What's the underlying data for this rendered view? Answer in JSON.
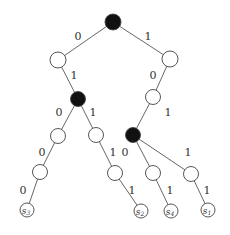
{
  "diagram": {
    "type": "binary-tree",
    "colors": {
      "filled": "#111111",
      "empty": "#ffffff",
      "edge": "#555555"
    },
    "nodes": [
      {
        "id": "root",
        "x": 113,
        "y": 22,
        "r": 8,
        "filled": true
      },
      {
        "id": "L1",
        "x": 58,
        "y": 60,
        "r": 8,
        "filled": false
      },
      {
        "id": "R1",
        "x": 170,
        "y": 59,
        "r": 8,
        "filled": false
      },
      {
        "id": "L2",
        "x": 78,
        "y": 99,
        "r": 7.5,
        "filled": true
      },
      {
        "id": "R2",
        "x": 153,
        "y": 97,
        "r": 7.5,
        "filled": false
      },
      {
        "id": "L3a",
        "x": 58,
        "y": 136,
        "r": 7.5,
        "filled": false
      },
      {
        "id": "L3b",
        "x": 96,
        "y": 135,
        "r": 7.5,
        "filled": false
      },
      {
        "id": "R3",
        "x": 133,
        "y": 135,
        "r": 7.5,
        "filled": true
      },
      {
        "id": "L4a",
        "x": 40,
        "y": 172,
        "r": 7.5,
        "filled": false
      },
      {
        "id": "L4b",
        "x": 115,
        "y": 173,
        "r": 7.5,
        "filled": false
      },
      {
        "id": "R4a",
        "x": 153,
        "y": 173,
        "r": 7.5,
        "filled": false
      },
      {
        "id": "R4b",
        "x": 191,
        "y": 174,
        "r": 7.5,
        "filled": false
      },
      {
        "id": "s3",
        "x": 27,
        "y": 210,
        "r": 7,
        "filled": false,
        "label": "s",
        "sub": "3"
      },
      {
        "id": "s2",
        "x": 141,
        "y": 211,
        "r": 7,
        "filled": false,
        "label": "s",
        "sub": "2"
      },
      {
        "id": "s4",
        "x": 171,
        "y": 211,
        "r": 7,
        "filled": false,
        "label": "s",
        "sub": "4"
      },
      {
        "id": "s1",
        "x": 208,
        "y": 210,
        "r": 7,
        "filled": false,
        "label": "s",
        "sub": "1"
      }
    ],
    "edges": [
      {
        "from": "root",
        "to": "L1",
        "label": "0",
        "lx": 78,
        "ly": 37
      },
      {
        "from": "root",
        "to": "R1",
        "label": "1",
        "lx": 148,
        "ly": 37
      },
      {
        "from": "L1",
        "to": "L2",
        "label": "1",
        "lx": 74,
        "ly": 76
      },
      {
        "from": "R1",
        "to": "R2",
        "label": "0",
        "lx": 153,
        "ly": 76
      },
      {
        "from": "L2",
        "to": "L3a",
        "label": "0",
        "lx": 59,
        "ly": 113
      },
      {
        "from": "L2",
        "to": "L3b",
        "label": "1",
        "lx": 93,
        "ly": 113
      },
      {
        "from": "R2",
        "to": "R3",
        "label": "1",
        "lx": 168,
        "ly": 113
      },
      {
        "from": "L3a",
        "to": "L4a",
        "label": "0",
        "lx": 42,
        "ly": 153
      },
      {
        "from": "L3b",
        "to": "L4b",
        "label": "1",
        "lx": 113,
        "ly": 153
      },
      {
        "from": "R3",
        "to": "R4a",
        "label": "0",
        "lx": 125,
        "ly": 153
      },
      {
        "from": "R3",
        "to": "R4b",
        "label": "1",
        "lx": 188,
        "ly": 153
      },
      {
        "from": "L4a",
        "to": "s3",
        "label": "0",
        "lx": 23,
        "ly": 191
      },
      {
        "from": "L4b",
        "to": "s2",
        "label": "1",
        "lx": 132,
        "ly": 191
      },
      {
        "from": "R4a",
        "to": "s4",
        "label": "1",
        "lx": 170,
        "ly": 191
      },
      {
        "from": "R4b",
        "to": "s1",
        "label": "1",
        "lx": 207,
        "ly": 191
      }
    ]
  }
}
